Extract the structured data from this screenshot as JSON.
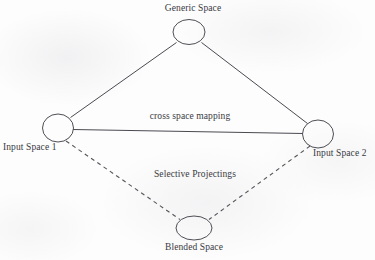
{
  "figure": {
    "background_color": "#fdfdfd",
    "stroke_color": "#4e4e55",
    "text_color": "#39393f"
  },
  "nodes": {
    "generic": {
      "label": "Generic Space",
      "shape": "ellipse",
      "cx": 189,
      "cy": 32,
      "rx": 16,
      "ry": 12.5
    },
    "input1": {
      "label": "Input Space 1",
      "shape": "ellipse",
      "cx": 58,
      "cy": 128,
      "rx": 15.5,
      "ry": 14
    },
    "input2": {
      "label": "Input Space 2",
      "shape": "ellipse",
      "cx": 318,
      "cy": 134,
      "rx": 15.5,
      "ry": 14
    },
    "blended": {
      "label": "Blended Space",
      "shape": "ellipse",
      "cx": 194,
      "cy": 228,
      "rx": 18,
      "ry": 12
    }
  },
  "edges": [
    {
      "name": "generic-to-input1",
      "from": "generic",
      "to": "input1",
      "style": "solid"
    },
    {
      "name": "generic-to-input2",
      "from": "generic",
      "to": "input2",
      "style": "solid"
    },
    {
      "name": "input1-to-input2",
      "from": "input1",
      "to": "input2",
      "style": "solid",
      "label": "cross space mapping"
    },
    {
      "name": "input1-to-blended",
      "from": "input1",
      "to": "blended",
      "style": "dashed"
    },
    {
      "name": "input2-to-blended",
      "from": "input2",
      "to": "blended",
      "style": "dashed"
    }
  ],
  "edge_labels": {
    "cross_space_mapping": "cross space mapping",
    "selective_projectings": "Selective Projectings"
  }
}
